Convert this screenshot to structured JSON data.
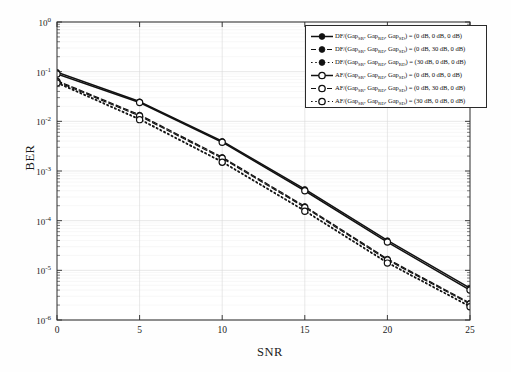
{
  "chart_data": {
    "type": "line",
    "title": "",
    "xlabel": "SNR",
    "ylabel": "BER",
    "xlim": [
      0,
      25
    ],
    "ylim": [
      1e-06,
      1
    ],
    "yscale": "log",
    "grid": true,
    "legend_position": "top-right",
    "x": [
      0,
      5,
      10,
      15,
      20,
      25
    ],
    "xticks": [
      "0",
      "5",
      "10",
      "15",
      "20",
      "25"
    ],
    "yticks": [
      "10^0",
      "10^-1",
      "10^-2",
      "10^-3",
      "10^-4",
      "10^-5",
      "10^-6"
    ],
    "series": [
      {
        "name": "DF/(Gap_SR, Gap_RD, Gap_SD) = (0 dB, 0 dB, 0 dB)",
        "scheme": "DF",
        "linestyle": "solid",
        "marker": "filled-circle",
        "color": "#111111",
        "values": [
          0.098,
          0.025,
          0.004,
          0.00043,
          4e-05,
          4.4e-06
        ]
      },
      {
        "name": "DF/(Gap_SR, Gap_RD, Gap_SD) = (0 dB, 30 dB, 0 dB)",
        "scheme": "DF",
        "linestyle": "dashed",
        "marker": "filled-circle",
        "color": "#111111",
        "values": [
          0.066,
          0.0135,
          0.0019,
          0.000195,
          1.7e-05,
          2.2e-06
        ]
      },
      {
        "name": "DF/(Gap_SR, Gap_RD, Gap_RD) = (30 dB, 0 dB, 0 dB)",
        "scheme": "DF",
        "linestyle": "dotted",
        "marker": "filled-circle",
        "color": "#111111",
        "values": [
          0.061,
          0.0112,
          0.00155,
          0.00016,
          1.45e-05,
          1.9e-06
        ]
      },
      {
        "name": "AF/(Gap_SR, Gap_RD, Gap_SD) = (0 dB, 0 dB, 0 dB)",
        "scheme": "AF",
        "linestyle": "solid",
        "marker": "open-circle",
        "color": "#111111",
        "values": [
          0.09,
          0.024,
          0.0038,
          0.0004,
          3.7e-05,
          4e-06
        ]
      },
      {
        "name": "AF/(Gap_SR, Gap_RD, Gap_SD) = (0 dB, 30 dB, 0 dB)",
        "scheme": "AF",
        "linestyle": "dashed",
        "marker": "open-circle",
        "color": "#111111",
        "values": [
          0.063,
          0.0128,
          0.0018,
          0.000185,
          1.62e-05,
          2.1e-06
        ]
      },
      {
        "name": "AF/(Gap_SR, Gap_RD, Gap_SD) = (30 dB, 0 dB, 0 dB)",
        "scheme": "AF",
        "linestyle": "dotted",
        "marker": "open-circle",
        "color": "#111111",
        "values": [
          0.059,
          0.0108,
          0.0015,
          0.000155,
          1.4e-05,
          1.85e-06
        ]
      }
    ]
  },
  "axes": {
    "xlabel": "SNR",
    "ylabel": "BER",
    "xticks": [
      {
        "label": "0",
        "value": 0
      },
      {
        "label": "5",
        "value": 5
      },
      {
        "label": "10",
        "value": 10
      },
      {
        "label": "15",
        "value": 15
      },
      {
        "label": "20",
        "value": 20
      },
      {
        "label": "25",
        "value": 25
      }
    ],
    "yticks": [
      {
        "base": "10",
        "exp": "0"
      },
      {
        "base": "10",
        "exp": "-1"
      },
      {
        "base": "10",
        "exp": "-2"
      },
      {
        "base": "10",
        "exp": "-3"
      },
      {
        "base": "10",
        "exp": "-4"
      },
      {
        "base": "10",
        "exp": "-5"
      },
      {
        "base": "10",
        "exp": "-6"
      }
    ]
  },
  "legend": {
    "entries": [
      {
        "scheme": "DF/(Gap",
        "sub1": "SR",
        "mid1": ", Gap",
        "sub2": "RD",
        "mid2": ", Gap",
        "sub3": "SD",
        "tail": ") = (0 dB, 0 dB, 0 dB)",
        "linestyle": "solid",
        "marker": "filled-circle"
      },
      {
        "scheme": "DF/(Gap",
        "sub1": "SR",
        "mid1": ", Gap",
        "sub2": "RD",
        "mid2": ", Gap",
        "sub3": "SD",
        "tail": ") = (0 dB, 30 dB, 0 dB)",
        "linestyle": "dashed",
        "marker": "filled-circle"
      },
      {
        "scheme": "DF/(Gap",
        "sub1": "SR",
        "mid1": ", Gap",
        "sub2": "RD",
        "mid2": ", Gap",
        "sub3": "RD",
        "tail": ") = (30 dB, 0 dB, 0 dB)",
        "linestyle": "dotted",
        "marker": "filled-circle"
      },
      {
        "scheme": "AF/(Gap",
        "sub1": "SR",
        "mid1": ", Gap",
        "sub2": "RD",
        "mid2": ", Gap",
        "sub3": "SD",
        "tail": ") = (0 dB, 0 dB, 0 dB)",
        "linestyle": "solid",
        "marker": "open-circle"
      },
      {
        "scheme": "AF/(Gap",
        "sub1": "SR",
        "mid1": ", Gap",
        "sub2": "RD",
        "mid2": ", Gap",
        "sub3": "SD",
        "tail": ") = (0 dB, 30 dB, 0 dB)",
        "linestyle": "dashed",
        "marker": "open-circle"
      },
      {
        "scheme": "AF/(Gap",
        "sub1": "SR",
        "mid1": ", Gap",
        "sub2": "RD",
        "mid2": ", Gap",
        "sub3": "SD",
        "tail": ") = (30 dB, 0 dB, 0 dB)",
        "linestyle": "dotted",
        "marker": "open-circle"
      }
    ]
  },
  "colors": {
    "line": "#111111",
    "axis": "#2a2a2a",
    "grid": "#d9d9d9",
    "minor_grid": "#ececec",
    "background": "#ffffff"
  }
}
